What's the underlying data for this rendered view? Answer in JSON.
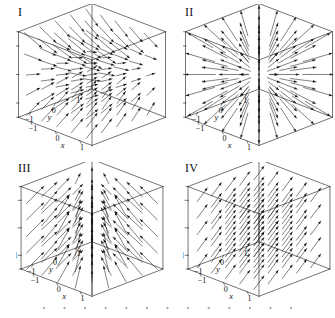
{
  "figure": {
    "background": "#ffffff",
    "ink": "#1a1a1a",
    "width": 335,
    "height": 318,
    "kind": "four 3D vector field plots in cube axes"
  },
  "axes": {
    "z_label": "z",
    "y_label": "y",
    "x_label": "x",
    "z_ticks": [
      "1",
      "0",
      "-1"
    ],
    "y_ticks": [
      "-1",
      "0",
      "1"
    ],
    "x_ticks": [
      "1",
      "0",
      "-1"
    ],
    "range_min": -1.5,
    "range_max": 1.5
  },
  "panels": [
    {
      "id": "panel-1",
      "label": "I",
      "field": "saddle",
      "description": "arrows sweep up-right in the upper half and up-right from lower-left in the lower half, forming a saddle pattern",
      "origin_x": 16,
      "origin_y": 4
    },
    {
      "id": "panel-2",
      "label": "II",
      "field": "radial",
      "description": "arrows radiate outward from the center of the cube in all directions",
      "origin_x": 183,
      "origin_y": 4
    },
    {
      "id": "panel-3",
      "label": "III",
      "field": "converging-upward",
      "description": "arrows point upward and converge toward the central vertical axis",
      "origin_x": 16,
      "origin_y": 162
    },
    {
      "id": "panel-4",
      "label": "IV",
      "field": "uniform",
      "description": "uniform parallel arrows all pointing up and to the right",
      "origin_x": 183,
      "origin_y": 162
    }
  ],
  "footer": {
    "dot_count": 13,
    "dot_color": "#9a9a9a"
  }
}
